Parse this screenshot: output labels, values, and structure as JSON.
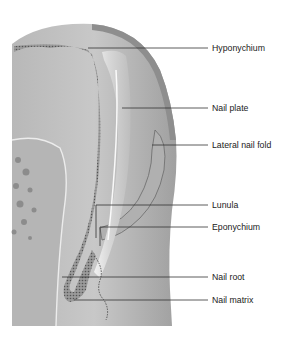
{
  "figure": {
    "colors": {
      "skin_light": "#c9c9c9",
      "skin_mid": "#a9a9a9",
      "skin_dark": "#8a8a8a",
      "nail_plate": "#e6e6e6",
      "leader_line": "#333333",
      "label_text": "#222222"
    },
    "labels": [
      {
        "id": "hyponychium",
        "text": "Hyponychium"
      },
      {
        "id": "nail-plate",
        "text": "Nail plate"
      },
      {
        "id": "lateral-nail-fold",
        "text": "Lateral nail fold"
      },
      {
        "id": "lunula",
        "text": "Lunula"
      },
      {
        "id": "eponychium",
        "text": "Eponychium"
      },
      {
        "id": "nail-root",
        "text": "Nail root"
      },
      {
        "id": "nail-matrix",
        "text": "Nail matrix"
      }
    ]
  }
}
